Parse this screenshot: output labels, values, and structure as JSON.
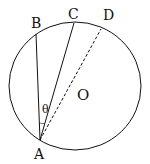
{
  "diagram": {
    "title": "",
    "circle": {
      "center_label": "O"
    },
    "points": {
      "A": "A",
      "B": "B",
      "C": "C",
      "D": "D"
    },
    "angle_label": "θ",
    "segments": [
      {
        "from": "A",
        "to": "B",
        "style": "solid"
      },
      {
        "from": "A",
        "to": "C",
        "style": "solid"
      },
      {
        "from": "A",
        "to": "D",
        "style": "dashed"
      }
    ],
    "colors": {
      "stroke": "#111111",
      "background": "#ffffff"
    }
  }
}
